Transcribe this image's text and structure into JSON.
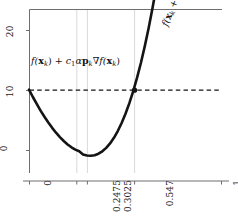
{
  "chart_data": {
    "type": "line",
    "title": "",
    "xlabel": "",
    "ylabel": "",
    "xlim": [
      0,
      1
    ],
    "ylim": [
      -2.2,
      26.5
    ],
    "grid": "vertical-only",
    "legend": "none",
    "x_ticks": [
      {
        "value": 0,
        "label": "0"
      },
      {
        "value": 0.2475,
        "label": "0.2475"
      },
      {
        "value": 0.3025,
        "label": "0.3025"
      },
      {
        "value": 0.547,
        "label": "0.547"
      },
      {
        "value": 1,
        "label": "1"
      }
    ],
    "y_ticks": [
      {
        "value": 0,
        "label": "0"
      },
      {
        "value": 10,
        "label": "10"
      },
      {
        "value": 20,
        "label": "20"
      }
    ],
    "gridlines_x": [
      0.2475,
      0.3025,
      0.547
    ],
    "series": [
      {
        "name": "f(x_k + alpha p_k)",
        "type": "line",
        "style": "solid",
        "width": 2.6,
        "color": "#141414",
        "x": [
          0.0,
          0.02,
          0.04,
          0.06,
          0.08,
          0.1,
          0.12,
          0.14,
          0.16,
          0.18,
          0.2,
          0.22,
          0.24,
          0.26,
          0.28,
          0.3,
          0.32,
          0.34,
          0.36,
          0.38,
          0.4,
          0.42,
          0.44,
          0.46,
          0.48,
          0.5,
          0.52,
          0.54,
          0.56,
          0.58,
          0.6,
          0.62,
          0.64,
          0.66,
          0.68,
          0.7
        ],
        "y": [
          12.4,
          11.1,
          9.88,
          8.72,
          7.64,
          6.63,
          5.7,
          4.85,
          4.08,
          3.4,
          2.8,
          2.3,
          1.9,
          1.6,
          1.02,
          0.86,
          0.82,
          0.92,
          1.18,
          1.6,
          2.2,
          2.98,
          3.96,
          5.14,
          6.54,
          8.16,
          10.02,
          12.12,
          14.48,
          17.1,
          20.0,
          23.18,
          26.66,
          30.44,
          34.54,
          38.96
        ]
      },
      {
        "name": "f(x_k) + c_1 alpha p_k grad f(x_k)",
        "type": "horizontal-line",
        "style": "dashed",
        "width": 1.2,
        "color": "#141414",
        "y_value": 12.3
      }
    ],
    "markers": [
      {
        "name": "intersection-point",
        "x": 0.547,
        "y": 12.3,
        "shape": "circle",
        "size": 4,
        "color": "#141414"
      }
    ],
    "annotations": [
      {
        "name": "threshold-label",
        "text": "f(xₖ) + c₁αpₖ∇f(xₖ)",
        "rotation": 0
      },
      {
        "name": "curve-label",
        "text": "f(xₖ + αpₖ)",
        "rotation": -68
      }
    ]
  },
  "axes": {
    "y_tick_labels": [
      "20",
      "10",
      "0"
    ],
    "x_tick_labels": [
      "0",
      "0.2475",
      "0.3025",
      "0.547",
      "1"
    ]
  },
  "annotations": {
    "threshold": {
      "f_open": "f(",
      "x_bold": "x",
      "k_sub": "k",
      "close_plus": ") + ",
      "c_var": "c",
      "c_sub": "1",
      "alpha": "α",
      "p_bold": "p",
      "p_sub": "k",
      "nabla": "∇",
      "f2": "f(",
      "x_bold2": "x",
      "k_sub2": "k",
      "close2": ")"
    },
    "curve": {
      "f_open": "f(",
      "x_bold": "x",
      "k_sub": "k",
      "plus": " + ",
      "alpha": "α",
      "p_bold": "p",
      "p_sub": "k",
      "close": ")"
    }
  },
  "colors": {
    "curve": "#141414",
    "dashed": "#141414",
    "gridline": "#d9d9d9",
    "axis": "#7a7a7a",
    "text": "#1a1a1a",
    "background": "#ffffff"
  }
}
